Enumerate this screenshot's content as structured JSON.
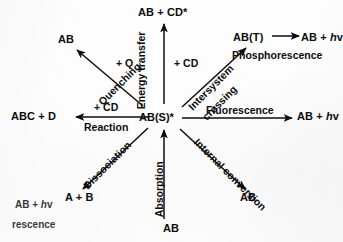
{
  "diagram": {
    "hub": {
      "label": "AB(S)*"
    },
    "nodes": [
      {
        "id": "energy_transfer_product",
        "label": "AB + CD*",
        "x": 165,
        "y": 13
      },
      {
        "id": "quenching_product",
        "label": "AB",
        "x": 66,
        "y": 40
      },
      {
        "id": "triplet",
        "label": "AB(T)",
        "x": 251,
        "y": 38
      },
      {
        "id": "phosphorescence_product",
        "label": "AB + hv",
        "x": 312,
        "y": 38
      },
      {
        "id": "reaction_product",
        "label": "ABC + D",
        "x": 40,
        "y": 117
      },
      {
        "id": "hub",
        "label": "AB(S)*",
        "x": 161,
        "y": 117
      },
      {
        "id": "fluorescence_product",
        "label": "AB + hv",
        "x": 310,
        "y": 117
      },
      {
        "id": "dissociation_product",
        "label": "A + B",
        "x": 80,
        "y": 198
      },
      {
        "id": "internal_conv_product",
        "label": "AB",
        "x": 249,
        "y": 198
      },
      {
        "id": "ground_state",
        "label": "AB",
        "x": 172,
        "y": 229
      }
    ],
    "reagents": [
      {
        "id": "quencher",
        "label": "+ Q",
        "x": 124,
        "y": 63
      },
      {
        "id": "energy_acceptor",
        "label": "+ CD",
        "x": 186,
        "y": 63
      },
      {
        "id": "reactant",
        "label": "+ CD",
        "x": 110,
        "y": 107
      }
    ],
    "processes": [
      {
        "id": "energy-transfer",
        "label": "Energy transfer",
        "x": 141,
        "y": 104,
        "rotate": -90
      },
      {
        "id": "quenching",
        "label": "Quenching",
        "x": 100,
        "y": 98,
        "rotate": -45
      },
      {
        "id": "intersystem-crossing-1",
        "label": "Intersystem",
        "x": 190,
        "y": 103,
        "rotate": -45
      },
      {
        "id": "intersystem-crossing-2",
        "label": "crossing",
        "x": 204,
        "y": 108,
        "rotate": -45
      },
      {
        "id": "phosphorescence",
        "label": "Phosphorescence",
        "x": 243,
        "y": 54,
        "rotate": 0
      },
      {
        "id": "fluorescence",
        "label": "Fluorescence",
        "x": 228,
        "y": 110,
        "rotate": 0
      },
      {
        "id": "reaction",
        "label": "Reaction",
        "x": 84,
        "y": 125,
        "rotate": 0
      },
      {
        "id": "dissociation",
        "label": "Dissociation",
        "x": 85,
        "y": 182,
        "rotate": -45
      },
      {
        "id": "absorption",
        "label": "Absorption",
        "x": 159,
        "y": 212,
        "rotate": -90
      },
      {
        "id": "internal-conversion",
        "label": "Internal conversion",
        "x": 196,
        "y": 135,
        "rotate": 45
      }
    ],
    "arrows": [
      {
        "id": "arrow-energy-transfer",
        "x1": 164,
        "y1": 104,
        "x2": 164,
        "y2": 24
      },
      {
        "id": "arrow-quenching",
        "x1": 143,
        "y1": 106,
        "x2": 77,
        "y2": 50
      },
      {
        "id": "arrow-intersystem-crossing",
        "x1": 182,
        "y1": 107,
        "x2": 246,
        "y2": 48
      },
      {
        "id": "arrow-phosphorescence",
        "x1": 272,
        "y1": 36,
        "x2": 299,
        "y2": 36
      },
      {
        "id": "arrow-reaction",
        "x1": 148,
        "y1": 117,
        "x2": 76,
        "y2": 117
      },
      {
        "id": "arrow-fluorescence",
        "x1": 182,
        "y1": 118,
        "x2": 292,
        "y2": 118
      },
      {
        "id": "arrow-dissociation",
        "x1": 148,
        "y1": 128,
        "x2": 83,
        "y2": 189
      },
      {
        "id": "arrow-absorption",
        "x1": 164,
        "y1": 219,
        "x2": 164,
        "y2": 130
      },
      {
        "id": "arrow-internal-conversion",
        "x1": 180,
        "y1": 129,
        "x2": 245,
        "y2": 189
      }
    ],
    "overlay_fragment": {
      "line1": "AB + hv",
      "line2": "rescence"
    },
    "colors": {
      "ink": "#0d0d0d",
      "background": "#fdfdfd",
      "fragment_ink": "#3a3a3a"
    }
  }
}
